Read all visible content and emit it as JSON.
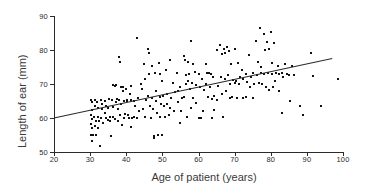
{
  "chart_data": {
    "type": "scatter",
    "title": "",
    "xlabel": "Age of patient (years)",
    "ylabel": "Length of ear (mm)",
    "xlim": [
      20,
      100
    ],
    "ylim": [
      50,
      90
    ],
    "xticks": [
      20,
      30,
      40,
      50,
      60,
      70,
      80,
      90,
      100
    ],
    "yticks": [
      50,
      60,
      70,
      80,
      90
    ],
    "grid": false,
    "legend": null,
    "marker": "square",
    "marker_color": "#111111",
    "line_color": "#2b2b2b",
    "trendline": {
      "type": "linear-regression",
      "x_start": 20,
      "y_start": 60.0,
      "x_end": 97,
      "y_end": 77.5,
      "slope": 0.227,
      "intercept": 55.45
    },
    "points": [
      [
        30.2,
        65.3
      ],
      [
        30.4,
        64.6
      ],
      [
        30.5,
        62.5
      ],
      [
        30.3,
        61.0
      ],
      [
        30.6,
        59.8
      ],
      [
        30.2,
        58.3
      ],
      [
        30.4,
        57.2
      ],
      [
        30.3,
        55.0
      ],
      [
        30.7,
        54.9
      ],
      [
        30.5,
        53.2
      ],
      [
        31.2,
        65.2
      ],
      [
        31.4,
        63.6
      ],
      [
        31.1,
        60.2
      ],
      [
        31.5,
        59.0
      ],
      [
        31.3,
        57.6
      ],
      [
        31.6,
        55.1
      ],
      [
        32.0,
        64.8
      ],
      [
        32.3,
        63.1
      ],
      [
        32.1,
        60.4
      ],
      [
        32.5,
        59.2
      ],
      [
        32.2,
        57.0
      ],
      [
        32.8,
        51.7
      ],
      [
        33.0,
        65.4
      ],
      [
        33.2,
        64.0
      ],
      [
        33.4,
        62.8
      ],
      [
        33.1,
        60.1
      ],
      [
        33.6,
        58.4
      ],
      [
        34.0,
        65.0
      ],
      [
        34.3,
        63.4
      ],
      [
        34.1,
        61.6
      ],
      [
        34.5,
        60.0
      ],
      [
        34.8,
        59.4
      ],
      [
        35.2,
        65.5
      ],
      [
        35.0,
        63.0
      ],
      [
        35.4,
        60.3
      ],
      [
        35.6,
        59.0
      ],
      [
        35.9,
        54.6
      ],
      [
        36.2,
        69.6
      ],
      [
        36.0,
        65.2
      ],
      [
        36.4,
        63.2
      ],
      [
        36.3,
        60.2
      ],
      [
        36.8,
        59.6
      ],
      [
        37.2,
        69.8
      ],
      [
        37.0,
        69.5
      ],
      [
        37.4,
        65.6
      ],
      [
        37.1,
        64.8
      ],
      [
        37.6,
        62.6
      ],
      [
        37.8,
        59.2
      ],
      [
        38.0,
        77.9
      ],
      [
        38.2,
        76.6
      ],
      [
        38.4,
        69.0
      ],
      [
        38.1,
        65.3
      ],
      [
        38.6,
        64.0
      ],
      [
        38.3,
        61.0
      ],
      [
        38.8,
        58.0
      ],
      [
        39.2,
        69.2
      ],
      [
        39.0,
        68.0
      ],
      [
        39.4,
        65.1
      ],
      [
        39.6,
        61.2
      ],
      [
        39.3,
        60.0
      ],
      [
        40.0,
        68.4
      ],
      [
        40.3,
        65.4
      ],
      [
        40.1,
        65.0
      ],
      [
        40.5,
        61.0
      ],
      [
        40.8,
        60.0
      ],
      [
        41.2,
        69.4
      ],
      [
        41.0,
        67.0
      ],
      [
        41.4,
        65.3
      ],
      [
        41.6,
        60.1
      ],
      [
        41.3,
        57.3
      ],
      [
        42.0,
        65.0
      ],
      [
        42.4,
        63.6
      ],
      [
        42.2,
        60.2
      ],
      [
        43.0,
        83.5
      ],
      [
        43.2,
        66.0
      ],
      [
        43.4,
        62.2
      ],
      [
        43.1,
        60.0
      ],
      [
        44.0,
        70.0
      ],
      [
        44.3,
        68.6
      ],
      [
        44.6,
        62.6
      ],
      [
        45.0,
        76.0
      ],
      [
        45.2,
        71.6
      ],
      [
        45.5,
        65.2
      ],
      [
        45.3,
        60.2
      ],
      [
        46.0,
        80.4
      ],
      [
        46.2,
        79.2
      ],
      [
        46.4,
        73.0
      ],
      [
        46.1,
        66.4
      ],
      [
        46.6,
        63.4
      ],
      [
        46.8,
        60.0
      ],
      [
        47.0,
        75.4
      ],
      [
        47.2,
        66.0
      ],
      [
        47.4,
        62.8
      ],
      [
        47.6,
        54.8
      ],
      [
        47.8,
        54.2
      ],
      [
        48.0,
        73.2
      ],
      [
        48.3,
        68.0
      ],
      [
        48.1,
        65.0
      ],
      [
        48.6,
        61.6
      ],
      [
        48.8,
        55.0
      ],
      [
        49.0,
        76.2
      ],
      [
        49.2,
        73.0
      ],
      [
        49.4,
        66.2
      ],
      [
        49.6,
        64.0
      ],
      [
        49.3,
        60.2
      ],
      [
        49.8,
        55.0
      ],
      [
        50.0,
        70.8
      ],
      [
        50.2,
        66.4
      ],
      [
        50.4,
        63.4
      ],
      [
        50.6,
        60.3
      ],
      [
        51.0,
        74.0
      ],
      [
        51.4,
        67.0
      ],
      [
        51.2,
        64.2
      ],
      [
        51.8,
        61.0
      ],
      [
        52.0,
        77.2
      ],
      [
        52.4,
        66.0
      ],
      [
        52.2,
        63.0
      ],
      [
        53.0,
        70.4
      ],
      [
        53.4,
        67.6
      ],
      [
        53.2,
        62.0
      ],
      [
        54.0,
        73.2
      ],
      [
        54.4,
        68.0
      ],
      [
        54.2,
        64.6
      ],
      [
        54.8,
        58.6
      ],
      [
        55.0,
        69.2
      ],
      [
        55.4,
        66.0
      ],
      [
        55.2,
        62.0
      ],
      [
        56.0,
        78.2
      ],
      [
        56.2,
        77.0
      ],
      [
        56.4,
        72.8
      ],
      [
        56.6,
        70.0
      ],
      [
        56.1,
        66.2
      ],
      [
        56.8,
        60.2
      ],
      [
        57.0,
        76.4
      ],
      [
        57.4,
        73.0
      ],
      [
        57.2,
        71.0
      ],
      [
        57.6,
        68.4
      ],
      [
        57.8,
        63.0
      ],
      [
        58.0,
        82.8
      ],
      [
        58.4,
        76.0
      ],
      [
        58.2,
        70.2
      ],
      [
        58.6,
        66.0
      ],
      [
        59.0,
        73.4
      ],
      [
        59.4,
        69.8
      ],
      [
        59.2,
        64.4
      ],
      [
        60.0,
        73.0
      ],
      [
        60.4,
        69.2
      ],
      [
        60.2,
        60.1
      ],
      [
        60.8,
        60.0
      ],
      [
        61.0,
        71.4
      ],
      [
        61.4,
        68.2
      ],
      [
        61.2,
        62.2
      ],
      [
        62.0,
        76.0
      ],
      [
        62.4,
        73.2
      ],
      [
        62.2,
        70.0
      ],
      [
        62.6,
        66.2
      ],
      [
        63.0,
        73.2
      ],
      [
        63.4,
        73.0
      ],
      [
        63.2,
        69.0
      ],
      [
        63.6,
        65.6
      ],
      [
        63.8,
        60.0
      ],
      [
        64.0,
        72.0
      ],
      [
        64.4,
        66.6
      ],
      [
        64.2,
        62.4
      ],
      [
        65.0,
        80.0
      ],
      [
        65.4,
        69.4
      ],
      [
        65.2,
        65.2
      ],
      [
        66.0,
        81.4
      ],
      [
        66.4,
        78.8
      ],
      [
        66.2,
        72.0
      ],
      [
        66.6,
        67.0
      ],
      [
        66.8,
        60.2
      ],
      [
        67.0,
        80.2
      ],
      [
        67.4,
        79.0
      ],
      [
        67.2,
        71.6
      ],
      [
        67.6,
        68.0
      ],
      [
        68.0,
        81.0
      ],
      [
        68.4,
        79.6
      ],
      [
        68.2,
        72.6
      ],
      [
        68.6,
        70.0
      ],
      [
        68.8,
        66.0
      ],
      [
        69.0,
        76.0
      ],
      [
        69.4,
        71.2
      ],
      [
        69.2,
        66.2
      ],
      [
        70.0,
        80.2
      ],
      [
        70.4,
        71.0
      ],
      [
        70.2,
        70.4
      ],
      [
        70.6,
        65.8
      ],
      [
        71.0,
        76.2
      ],
      [
        71.4,
        72.0
      ],
      [
        71.2,
        70.0
      ],
      [
        72.0,
        74.0
      ],
      [
        72.4,
        71.4
      ],
      [
        72.2,
        66.0
      ],
      [
        73.0,
        73.0
      ],
      [
        73.4,
        70.6
      ],
      [
        73.2,
        66.2
      ],
      [
        74.0,
        78.4
      ],
      [
        74.4,
        72.0
      ],
      [
        74.2,
        69.2
      ],
      [
        75.0,
        73.2
      ],
      [
        75.4,
        70.0
      ],
      [
        75.2,
        66.0
      ],
      [
        76.0,
        82.6
      ],
      [
        76.4,
        76.4
      ],
      [
        76.2,
        72.6
      ],
      [
        76.6,
        70.2
      ],
      [
        77.0,
        86.4
      ],
      [
        77.4,
        75.0
      ],
      [
        77.2,
        73.2
      ],
      [
        77.6,
        70.0
      ],
      [
        78.0,
        84.6
      ],
      [
        78.4,
        80.0
      ],
      [
        78.2,
        73.0
      ],
      [
        78.6,
        69.0
      ],
      [
        79.0,
        82.4
      ],
      [
        79.4,
        80.2
      ],
      [
        79.2,
        73.2
      ],
      [
        79.6,
        68.2
      ],
      [
        80.0,
        85.2
      ],
      [
        80.4,
        76.2
      ],
      [
        80.2,
        73.0
      ],
      [
        80.6,
        69.0
      ],
      [
        81.0,
        82.2
      ],
      [
        81.4,
        73.2
      ],
      [
        81.2,
        71.0
      ],
      [
        82.0,
        75.4
      ],
      [
        82.4,
        73.0
      ],
      [
        82.2,
        68.0
      ],
      [
        83.0,
        73.2
      ],
      [
        83.4,
        72.0
      ],
      [
        83.2,
        61.4
      ],
      [
        84.0,
        76.0
      ],
      [
        84.4,
        73.0
      ],
      [
        85.0,
        72.8
      ],
      [
        85.4,
        65.0
      ],
      [
        86.0,
        75.4
      ],
      [
        86.4,
        72.8
      ],
      [
        88.0,
        63.6
      ],
      [
        89.0,
        61.0
      ],
      [
        91.2,
        79.2
      ],
      [
        91.8,
        72.4
      ],
      [
        94.0,
        63.4
      ],
      [
        98.5,
        71.6
      ]
    ]
  }
}
